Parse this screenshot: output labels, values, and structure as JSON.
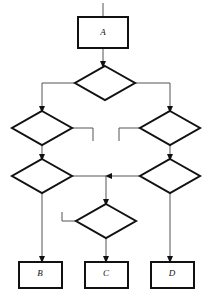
{
  "diagram": {
    "type": "flowchart",
    "canvas": {
      "width": 213,
      "height": 297
    },
    "style": {
      "background_color": "#ffffff",
      "node_fill": "#ffffff",
      "node_stroke": "#111111",
      "connector_stroke": "#555555",
      "arrowhead_fill": "#111111",
      "label_color": "#111111"
    },
    "nodes": [
      {
        "id": "A",
        "label": "A",
        "shape": "process",
        "x": 78,
        "y": 17,
        "width": 50,
        "height": 31,
        "cx": 103,
        "cy": 32
      },
      {
        "id": "D1",
        "label": "",
        "shape": "decision",
        "cx": 105,
        "cy": 83,
        "rx": 30,
        "ry": 17
      },
      {
        "id": "D2",
        "label": "",
        "shape": "decision",
        "cx": 42,
        "cy": 128,
        "rx": 30,
        "ry": 17
      },
      {
        "id": "D3",
        "label": "",
        "shape": "decision",
        "cx": 170,
        "cy": 128,
        "rx": 30,
        "ry": 17
      },
      {
        "id": "D4",
        "label": "",
        "shape": "decision",
        "cx": 42,
        "cy": 176,
        "rx": 30,
        "ry": 17
      },
      {
        "id": "D5",
        "label": "",
        "shape": "decision",
        "cx": 170,
        "cy": 176,
        "rx": 30,
        "ry": 17
      },
      {
        "id": "D6",
        "label": "",
        "shape": "decision",
        "cx": 106,
        "cy": 221,
        "rx": 30,
        "ry": 17
      },
      {
        "id": "B",
        "label": "B",
        "shape": "process",
        "x": 19,
        "y": 262,
        "width": 43,
        "height": 26,
        "cx": 40,
        "cy": 275
      },
      {
        "id": "C",
        "label": "C",
        "shape": "process",
        "x": 85,
        "y": 262,
        "width": 43,
        "height": 26,
        "cx": 106,
        "cy": 275
      },
      {
        "id": "D",
        "label": "D",
        "shape": "process",
        "x": 151,
        "y": 262,
        "width": 43,
        "height": 26,
        "cx": 172,
        "cy": 275
      }
    ],
    "edges": [
      {
        "id": "e-entry-A",
        "from": "start",
        "to": "A",
        "arrow": true,
        "points": "103,3 103,17"
      },
      {
        "id": "e-A-D1",
        "from": "A",
        "to": "D1",
        "arrow": true,
        "points": "103,48 103,66"
      },
      {
        "id": "e-D1-D2",
        "from": "D1",
        "to": "D2",
        "arrow": true,
        "points": "75,83 42,83 42,111"
      },
      {
        "id": "e-D1-D3",
        "from": "D1",
        "to": "D3",
        "arrow": true,
        "points": "135,83 170,83 170,111"
      },
      {
        "id": "e-D2-D4",
        "from": "D2",
        "to": "D4",
        "arrow": true,
        "points": "42,145 42,159"
      },
      {
        "id": "e-D3-D5",
        "from": "D3",
        "to": "D5",
        "arrow": true,
        "points": "170,145 170,159"
      },
      {
        "id": "e-D2-stub",
        "from": "D2",
        "to": "stub-left",
        "arrow": false,
        "points": "72,128 93,128 93,140"
      },
      {
        "id": "e-D3-stub",
        "from": "D3",
        "to": "stub-right",
        "arrow": false,
        "points": "140,128 119,128 119,140"
      },
      {
        "id": "e-D4-merge",
        "from": "D4",
        "to": "merge",
        "arrow": false,
        "points": "72,176 106,176"
      },
      {
        "id": "e-D5-merge",
        "from": "D5",
        "to": "merge",
        "arrow": true,
        "points": "140,176 106,176"
      },
      {
        "id": "e-merge-D6",
        "from": "merge",
        "to": "D6",
        "arrow": true,
        "points": "106,176 106,204"
      },
      {
        "id": "e-D6-stub",
        "from": "D6",
        "to": "stub-center",
        "arrow": false,
        "points": "76,221 62,221 62,213"
      },
      {
        "id": "e-D4-B",
        "from": "D4",
        "to": "B",
        "arrow": true,
        "points": "42,193 42,261"
      },
      {
        "id": "e-D6-C",
        "from": "D6",
        "to": "C",
        "arrow": true,
        "points": "106,238 106,261"
      },
      {
        "id": "e-D5-D",
        "from": "D5",
        "to": "D",
        "arrow": true,
        "points": "170,193 170,261"
      }
    ]
  }
}
